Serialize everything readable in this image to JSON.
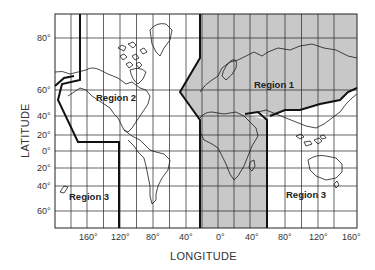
{
  "map": {
    "frame": {
      "left": 55,
      "top": 14,
      "right": 357,
      "bottom": 228
    },
    "colors": {
      "shade": "#c8c8c8",
      "line": "#1a1a1a",
      "grid": "#222222",
      "bg": "#ffffff"
    },
    "regions": [
      {
        "id": "region-2",
        "label": "Region 2",
        "x": 96,
        "y": 97
      },
      {
        "id": "region-1",
        "label": "Region 1",
        "x": 254,
        "y": 84
      },
      {
        "id": "region-3-west",
        "label": "Region 3",
        "x": 69,
        "y": 196
      },
      {
        "id": "region-3-east",
        "label": "Region 3",
        "x": 286,
        "y": 194
      }
    ],
    "lat_ticks": [
      {
        "label": "80°",
        "y": 38
      },
      {
        "label": "60°",
        "y": 90
      },
      {
        "label": "40°",
        "y": 116
      },
      {
        "label": "20°",
        "y": 135
      },
      {
        "label": "0°",
        "y": 151
      },
      {
        "label": "20°",
        "y": 168
      },
      {
        "label": "40°",
        "y": 186
      },
      {
        "label": "60°",
        "y": 211
      }
    ],
    "lon_ticks": [
      {
        "label": "160°",
        "x": 87
      },
      {
        "label": "120°",
        "x": 120
      },
      {
        "label": "80°",
        "x": 153
      },
      {
        "label": "40°",
        "x": 186
      },
      {
        "label": "0°",
        "x": 218
      },
      {
        "label": "40°",
        "x": 250
      },
      {
        "label": "80°",
        "x": 285
      },
      {
        "label": "120°",
        "x": 318
      },
      {
        "label": "160°",
        "x": 350
      }
    ],
    "axis_titles": {
      "x": "LONGITUDE",
      "y": "LATITUDE"
    }
  }
}
